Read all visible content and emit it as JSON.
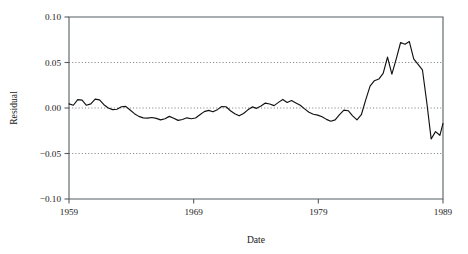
{
  "chart_data": {
    "type": "line",
    "title": "",
    "xlabel": "Date",
    "ylabel": "Residual",
    "xlim": [
      1959,
      1989
    ],
    "ylim": [
      -0.1,
      0.1
    ],
    "grid": true,
    "grid_values": [
      0.05,
      0.0,
      -0.05
    ],
    "legend": "none",
    "xticks": [
      1959,
      1969,
      1979,
      1989
    ],
    "xticklabels": [
      "1959",
      "1969",
      "1979",
      "1989"
    ],
    "yticks": [
      0.1,
      0.05,
      0.0,
      -0.05,
      -0.1
    ],
    "yticklabels": [
      "0.10",
      "0.05",
      "0.00",
      "−0.05",
      "−0.10"
    ],
    "series": [
      {
        "name": "Residual",
        "color": "#111111",
        "x": [
          1959.0,
          1959.35,
          1959.7,
          1960.05,
          1960.4,
          1960.75,
          1961.1,
          1961.45,
          1961.8,
          1962.15,
          1962.5,
          1962.85,
          1963.2,
          1963.55,
          1963.9,
          1964.25,
          1964.6,
          1964.95,
          1965.3,
          1965.65,
          1966.0,
          1966.35,
          1966.7,
          1967.05,
          1967.4,
          1967.75,
          1968.1,
          1968.45,
          1968.8,
          1969.15,
          1969.5,
          1969.85,
          1970.2,
          1970.55,
          1970.9,
          1971.25,
          1971.6,
          1971.95,
          1972.3,
          1972.65,
          1973.0,
          1973.35,
          1973.7,
          1974.05,
          1974.4,
          1974.75,
          1975.1,
          1975.45,
          1975.8,
          1976.15,
          1976.5,
          1976.85,
          1977.2,
          1977.55,
          1977.9,
          1978.25,
          1978.6,
          1978.95,
          1979.3,
          1979.65,
          1980.0,
          1980.35,
          1980.7,
          1981.05,
          1981.4,
          1981.75,
          1982.1,
          1982.45,
          1982.8,
          1983.15,
          1983.5,
          1983.85,
          1984.2,
          1984.55,
          1984.9,
          1985.25,
          1985.6,
          1985.95,
          1986.3,
          1986.65,
          1987.0,
          1987.35,
          1987.7,
          1988.05,
          1988.4,
          1988.75,
          1989.0
        ],
        "y": [
          0.0045,
          0.003,
          0.0092,
          0.0086,
          0.003,
          0.0045,
          0.0098,
          0.009,
          0.0036,
          0.0,
          -0.0018,
          -0.0014,
          0.0014,
          0.0018,
          -0.0022,
          -0.0062,
          -0.0092,
          -0.0108,
          -0.0112,
          -0.0105,
          -0.0114,
          -0.013,
          -0.0118,
          -0.0092,
          -0.0112,
          -0.0136,
          -0.0126,
          -0.0108,
          -0.0118,
          -0.011,
          -0.0074,
          -0.004,
          -0.0026,
          -0.0042,
          -0.0018,
          0.0016,
          0.0014,
          -0.003,
          -0.0064,
          -0.0086,
          -0.006,
          -0.002,
          0.0012,
          -0.0004,
          0.0022,
          0.0054,
          0.0044,
          0.0026,
          0.0062,
          0.0094,
          0.006,
          0.0082,
          0.0056,
          0.003,
          -0.001,
          -0.0046,
          -0.0068,
          -0.0078,
          -0.0096,
          -0.0125,
          -0.0146,
          -0.013,
          -0.0072,
          -0.0024,
          -0.003,
          -0.0086,
          -0.013,
          -0.0074,
          0.009,
          0.024,
          0.03,
          0.0318,
          0.038,
          0.056,
          0.0372,
          0.054,
          0.072,
          0.07,
          0.073,
          0.054,
          0.048,
          0.042,
          0.006,
          -0.034,
          -0.026,
          -0.03,
          -0.017
        ],
        "peak_value": 0.073,
        "trough_value": -0.082
      }
    ]
  },
  "axis": {
    "ylabel": "Residual",
    "xlabel": "Date"
  }
}
